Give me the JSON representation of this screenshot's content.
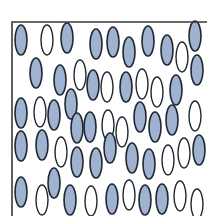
{
  "diagram": {
    "colors": {
      "filled": "#9fb3d1",
      "outline": "#1f2730",
      "open_fill": "#ffffff",
      "frame": "#3a3a3a",
      "background": "#ffffff"
    },
    "frame": {
      "left": 12,
      "top": 22,
      "right": 207,
      "bottom": 216
    },
    "ellipse_size": {
      "rx": 6,
      "ry": 15
    },
    "ellipses": [
      {
        "x": 21,
        "y": 40,
        "filled": true
      },
      {
        "x": 47,
        "y": 40,
        "filled": false
      },
      {
        "x": 67,
        "y": 38,
        "filled": true
      },
      {
        "x": 96,
        "y": 44,
        "filled": true
      },
      {
        "x": 113,
        "y": 42,
        "filled": true
      },
      {
        "x": 129,
        "y": 52,
        "filled": true
      },
      {
        "x": 148,
        "y": 41,
        "filled": true
      },
      {
        "x": 167,
        "y": 50,
        "filled": true
      },
      {
        "x": 182,
        "y": 57,
        "filled": false
      },
      {
        "x": 195,
        "y": 36,
        "filled": true
      },
      {
        "x": 36,
        "y": 73,
        "filled": true
      },
      {
        "x": 60,
        "y": 80,
        "filled": true
      },
      {
        "x": 80,
        "y": 75,
        "filled": false
      },
      {
        "x": 107,
        "y": 87,
        "filled": false
      },
      {
        "x": 126,
        "y": 87,
        "filled": true
      },
      {
        "x": 142,
        "y": 84,
        "filled": false
      },
      {
        "x": 157,
        "y": 92,
        "filled": false
      },
      {
        "x": 176,
        "y": 90,
        "filled": true
      },
      {
        "x": 197,
        "y": 70,
        "filled": true
      },
      {
        "x": 93,
        "y": 85,
        "filled": true
      },
      {
        "x": 71,
        "y": 104,
        "filled": true
      },
      {
        "x": 21,
        "y": 113,
        "filled": true
      },
      {
        "x": 40,
        "y": 112,
        "filled": false
      },
      {
        "x": 54,
        "y": 115,
        "filled": true
      },
      {
        "x": 77,
        "y": 128,
        "filled": true
      },
      {
        "x": 90,
        "y": 127,
        "filled": true
      },
      {
        "x": 108,
        "y": 125,
        "filled": false
      },
      {
        "x": 122,
        "y": 132,
        "filled": false
      },
      {
        "x": 140,
        "y": 117,
        "filled": true
      },
      {
        "x": 155,
        "y": 127,
        "filled": true
      },
      {
        "x": 172,
        "y": 120,
        "filled": true
      },
      {
        "x": 195,
        "y": 116,
        "filled": false
      },
      {
        "x": 21,
        "y": 146,
        "filled": true
      },
      {
        "x": 42,
        "y": 145,
        "filled": true
      },
      {
        "x": 61,
        "y": 152,
        "filled": false
      },
      {
        "x": 77,
        "y": 162,
        "filled": true
      },
      {
        "x": 96,
        "y": 163,
        "filled": true
      },
      {
        "x": 110,
        "y": 148,
        "filled": true
      },
      {
        "x": 132,
        "y": 158,
        "filled": true
      },
      {
        "x": 149,
        "y": 164,
        "filled": true
      },
      {
        "x": 168,
        "y": 160,
        "filled": false
      },
      {
        "x": 184,
        "y": 153,
        "filled": false
      },
      {
        "x": 199,
        "y": 150,
        "filled": true
      },
      {
        "x": 21,
        "y": 192,
        "filled": true
      },
      {
        "x": 42,
        "y": 200,
        "filled": false
      },
      {
        "x": 54,
        "y": 183,
        "filled": true
      },
      {
        "x": 70,
        "y": 200,
        "filled": true
      },
      {
        "x": 91,
        "y": 201,
        "filled": false
      },
      {
        "x": 112,
        "y": 199,
        "filled": true
      },
      {
        "x": 129,
        "y": 195,
        "filled": false
      },
      {
        "x": 145,
        "y": 200,
        "filled": true
      },
      {
        "x": 162,
        "y": 199,
        "filled": true
      },
      {
        "x": 180,
        "y": 196,
        "filled": false
      },
      {
        "x": 197,
        "y": 204,
        "filled": false
      }
    ]
  }
}
